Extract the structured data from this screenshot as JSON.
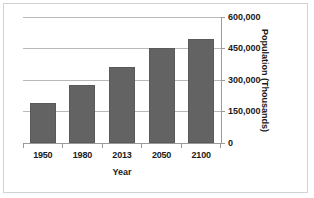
{
  "chart_data": {
    "type": "bar",
    "title": "",
    "categories": [
      "1950",
      "1980",
      "2013",
      "2050",
      "2100"
    ],
    "values": [
      189000,
      276000,
      363000,
      450000,
      493000
    ],
    "series": [
      {
        "name": "Population",
        "values": [
          189000,
          276000,
          363000,
          450000,
          493000
        ]
      }
    ],
    "xlabel": "Year",
    "ylabel": "Population (Thousands)",
    "ylim": [
      0,
      600000
    ],
    "yticks": [
      0,
      150000,
      300000,
      450000,
      600000
    ],
    "ytick_labels": [
      "0",
      "150,000",
      "300,000",
      "450,000",
      "600,000"
    ],
    "grid": true,
    "legend": false,
    "y_axis_position": "right",
    "bar_color": "#636363",
    "gridline_color": "#b9b9b9",
    "axis_color": "#9a9a9a",
    "text_color": "#1a1a1a"
  }
}
